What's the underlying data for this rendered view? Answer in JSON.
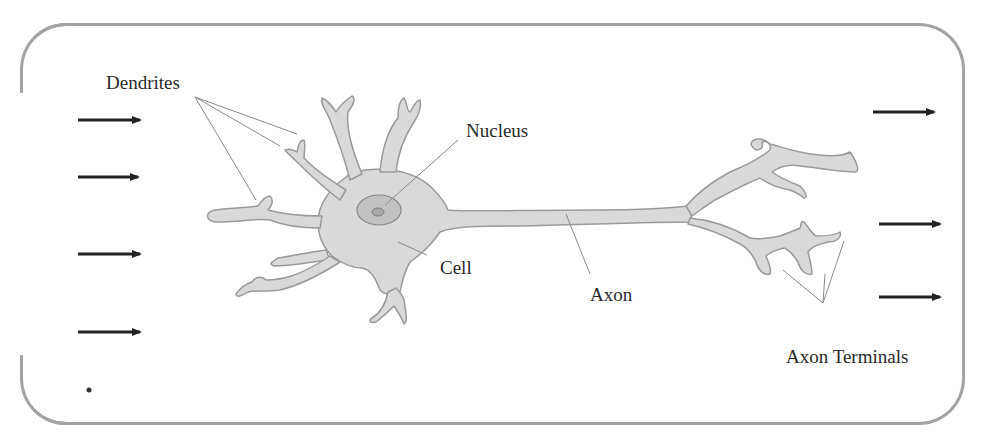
{
  "labels": {
    "dendrites": "Dendrites",
    "nucleus": "Nucleus",
    "cell": "Cell",
    "axon": "Axon",
    "axon_terminals": "Axon Terminals"
  },
  "colors": {
    "frame": "#a3a3a3",
    "neuron_fill": "#d9d9d9",
    "neuron_outline": "#9a9a9a",
    "nucleus_fill": "#bdbdbd",
    "arrow": "#222222",
    "leader_line": "#8a8a8a",
    "text": "#2a2a2a"
  },
  "input_arrows": [
    {
      "y": 120
    },
    {
      "y": 177
    },
    {
      "y": 253
    },
    {
      "y": 331
    }
  ],
  "output_arrows": [
    {
      "y": 112
    },
    {
      "y": 224
    },
    {
      "y": 297
    }
  ]
}
